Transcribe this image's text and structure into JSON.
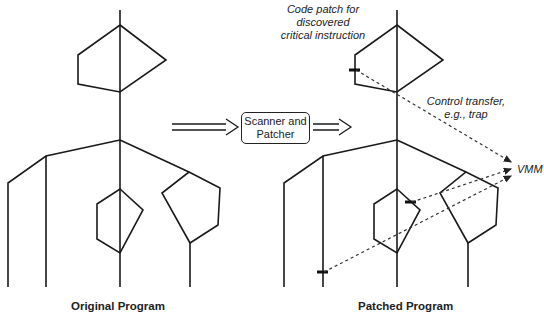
{
  "process_box": {
    "line1": "Scanner and",
    "line2": "Patcher"
  },
  "captions": {
    "original": "Original Program",
    "patched": "Patched Program"
  },
  "annotations": {
    "code_patch": {
      "line1": "Code patch for",
      "line2": "discovered",
      "line3": "critical instruction"
    },
    "control_transfer": {
      "line1": "Control transfer,",
      "line2": "e.g., trap"
    },
    "vmm": "VMM"
  },
  "colors": {
    "line": "#1a1a1a",
    "background": "#ffffff"
  }
}
